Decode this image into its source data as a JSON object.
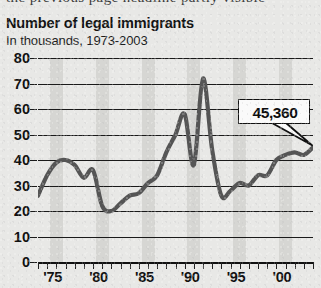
{
  "page": {
    "clipped_header_text": "the previous page headline partly visible",
    "background_color": "#e8e8e6"
  },
  "chart_data": {
    "type": "line",
    "title": "Number of legal immigrants",
    "subtitle": "In thousands, 1973-2003",
    "xlabel": "",
    "ylabel": "",
    "ylim": [
      0,
      80
    ],
    "xlim": [
      1973,
      2003
    ],
    "yticks": [
      0,
      10,
      20,
      30,
      40,
      50,
      60,
      70,
      80
    ],
    "ytick_labels": [
      "0",
      "10",
      "20",
      "30",
      "40",
      "50",
      "60",
      "70",
      "80"
    ],
    "xtick_labels": [
      "'75",
      "'80",
      "'85",
      "'90",
      "'95",
      "'00"
    ],
    "xtick_years": [
      1975,
      1980,
      1985,
      1990,
      1995,
      2000
    ],
    "grid": "horizontal",
    "legend": "none",
    "line_color": "#555555",
    "grid_color": "#1a1a1a",
    "band_color": "#d2d2cf",
    "band_years": [
      1975,
      1980,
      1985,
      1990,
      1995,
      2000
    ],
    "x": [
      1973,
      1974,
      1975,
      1976,
      1977,
      1978,
      1979,
      1980,
      1981,
      1982,
      1983,
      1984,
      1985,
      1986,
      1987,
      1988,
      1989,
      1990,
      1991,
      1992,
      1993,
      1994,
      1995,
      1996,
      1997,
      1998,
      1999,
      2000,
      2001,
      2002,
      2003
    ],
    "values": [
      26,
      34,
      39,
      40,
      38,
      33,
      36,
      22,
      20,
      23,
      26,
      27,
      31,
      34,
      43,
      50,
      58,
      38,
      72,
      44,
      26,
      28,
      31,
      30,
      34,
      34,
      40,
      42,
      43,
      42,
      45
    ],
    "annotations": [
      {
        "text": "45,360",
        "points_to_year": 2003,
        "points_to_value": 45
      }
    ]
  }
}
